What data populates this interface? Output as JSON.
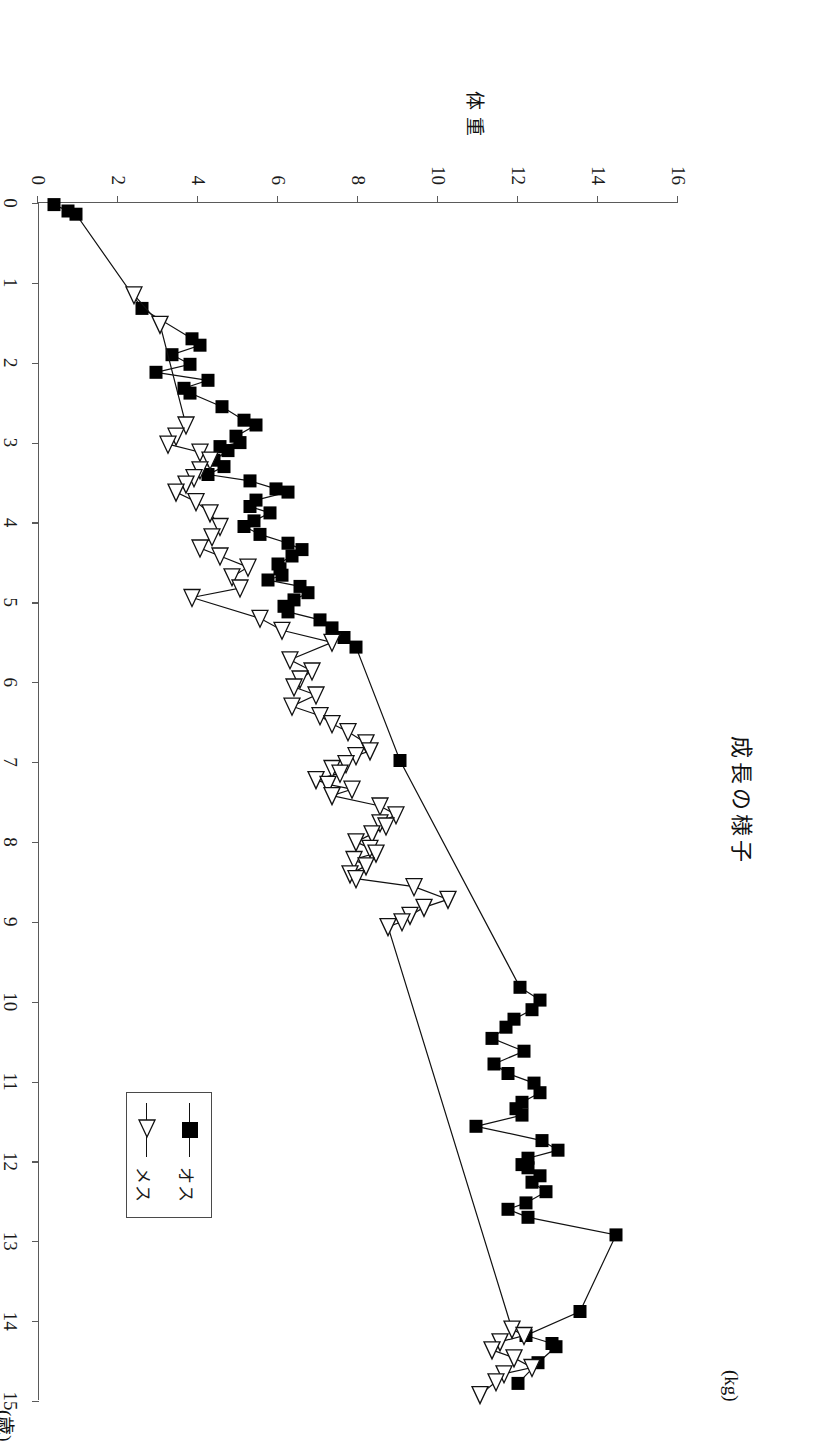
{
  "title": "成長の様子",
  "axes": {
    "x_title": "年齢",
    "x_unit": "(歳)",
    "y_title": "体重",
    "y_unit": "(kg)",
    "x_ticks": [
      "0",
      "1",
      "2",
      "3",
      "4",
      "5",
      "6",
      "7",
      "8",
      "9",
      "10",
      "11",
      "12",
      "13",
      "14",
      "15"
    ],
    "y_ticks": [
      "0",
      "2",
      "4",
      "6",
      "8",
      "10",
      "12",
      "14",
      "16"
    ],
    "x_min": 0,
    "x_max": 15,
    "y_min": 0,
    "y_max": 16
  },
  "legend": {
    "items": [
      {
        "label": "オス",
        "marker": "filled-square"
      },
      {
        "label": "メス",
        "marker": "open-triangle"
      }
    ]
  },
  "chart_data": {
    "type": "line",
    "title": "成長の様子",
    "xlabel": "年齢 (歳)",
    "ylabel": "体重 (kg)",
    "xlim": [
      0,
      15
    ],
    "ylim": [
      0,
      16
    ],
    "grid": false,
    "legend_position": "bottom-left",
    "series": [
      {
        "name": "オス",
        "marker": "filled-square",
        "points": [
          [
            0.02,
            0.4
          ],
          [
            0.1,
            0.75
          ],
          [
            0.14,
            0.95
          ],
          [
            1.32,
            2.6
          ],
          [
            1.7,
            3.85
          ],
          [
            1.78,
            4.05
          ],
          [
            1.9,
            3.35
          ],
          [
            2.02,
            3.8
          ],
          [
            2.12,
            2.95
          ],
          [
            2.22,
            4.25
          ],
          [
            2.32,
            3.65
          ],
          [
            2.38,
            3.8
          ],
          [
            2.55,
            4.6
          ],
          [
            2.72,
            5.15
          ],
          [
            2.78,
            5.45
          ],
          [
            2.92,
            4.95
          ],
          [
            3.0,
            5.05
          ],
          [
            3.05,
            4.55
          ],
          [
            3.1,
            4.75
          ],
          [
            3.22,
            4.4
          ],
          [
            3.3,
            4.65
          ],
          [
            3.4,
            4.25
          ],
          [
            3.48,
            5.3
          ],
          [
            3.58,
            5.95
          ],
          [
            3.62,
            6.25
          ],
          [
            3.72,
            5.45
          ],
          [
            3.8,
            5.3
          ],
          [
            3.88,
            5.8
          ],
          [
            3.98,
            5.4
          ],
          [
            4.05,
            5.15
          ],
          [
            4.15,
            5.55
          ],
          [
            4.26,
            6.25
          ],
          [
            4.34,
            6.6
          ],
          [
            4.42,
            6.35
          ],
          [
            4.52,
            6.0
          ],
          [
            4.58,
            6.05
          ],
          [
            4.66,
            6.1
          ],
          [
            4.72,
            5.75
          ],
          [
            4.8,
            6.55
          ],
          [
            4.88,
            6.75
          ],
          [
            4.97,
            6.4
          ],
          [
            5.05,
            6.15
          ],
          [
            5.12,
            6.25
          ],
          [
            5.22,
            7.05
          ],
          [
            5.32,
            7.35
          ],
          [
            5.44,
            7.65
          ],
          [
            5.56,
            7.95
          ],
          [
            6.98,
            9.05
          ],
          [
            9.82,
            12.05
          ],
          [
            9.98,
            12.55
          ],
          [
            10.1,
            12.35
          ],
          [
            10.22,
            11.9
          ],
          [
            10.32,
            11.7
          ],
          [
            10.46,
            11.35
          ],
          [
            10.62,
            12.15
          ],
          [
            10.78,
            11.4
          ],
          [
            10.9,
            11.75
          ],
          [
            11.02,
            12.4
          ],
          [
            11.14,
            12.55
          ],
          [
            11.26,
            12.1
          ],
          [
            11.34,
            11.95
          ],
          [
            11.42,
            12.1
          ],
          [
            11.56,
            10.95
          ],
          [
            11.74,
            12.6
          ],
          [
            11.86,
            13.0
          ],
          [
            11.96,
            12.25
          ],
          [
            12.04,
            12.1
          ],
          [
            12.08,
            12.25
          ],
          [
            12.18,
            12.55
          ],
          [
            12.26,
            12.35
          ],
          [
            12.38,
            12.7
          ],
          [
            12.52,
            12.2
          ],
          [
            12.6,
            11.75
          ],
          [
            12.7,
            12.25
          ],
          [
            12.92,
            14.45
          ],
          [
            13.88,
            13.55
          ],
          [
            14.18,
            12.2
          ],
          [
            14.28,
            12.85
          ],
          [
            14.32,
            12.95
          ],
          [
            14.52,
            12.5
          ],
          [
            14.78,
            12.0
          ]
        ]
      },
      {
        "name": "メス",
        "marker": "open-triangle",
        "points": [
          [
            1.15,
            2.4
          ],
          [
            1.52,
            3.05
          ],
          [
            2.78,
            3.7
          ],
          [
            2.92,
            3.45
          ],
          [
            3.02,
            3.25
          ],
          [
            3.12,
            4.05
          ],
          [
            3.22,
            4.3
          ],
          [
            3.34,
            4.05
          ],
          [
            3.44,
            3.9
          ],
          [
            3.52,
            3.7
          ],
          [
            3.62,
            3.45
          ],
          [
            3.74,
            3.95
          ],
          [
            3.88,
            4.3
          ],
          [
            4.05,
            4.55
          ],
          [
            4.18,
            4.35
          ],
          [
            4.32,
            4.05
          ],
          [
            4.42,
            4.55
          ],
          [
            4.56,
            5.25
          ],
          [
            4.68,
            4.85
          ],
          [
            4.82,
            5.05
          ],
          [
            4.94,
            3.85
          ],
          [
            5.2,
            5.55
          ],
          [
            5.35,
            6.1
          ],
          [
            5.5,
            7.35
          ],
          [
            5.72,
            6.3
          ],
          [
            5.86,
            6.85
          ],
          [
            5.96,
            6.55
          ],
          [
            6.06,
            6.4
          ],
          [
            6.16,
            6.95
          ],
          [
            6.3,
            6.35
          ],
          [
            6.42,
            7.05
          ],
          [
            6.52,
            7.35
          ],
          [
            6.62,
            7.75
          ],
          [
            6.76,
            8.2
          ],
          [
            6.86,
            8.3
          ],
          [
            6.92,
            7.95
          ],
          [
            7.02,
            7.7
          ],
          [
            7.08,
            7.35
          ],
          [
            7.14,
            7.55
          ],
          [
            7.22,
            6.95
          ],
          [
            7.28,
            7.25
          ],
          [
            7.34,
            7.85
          ],
          [
            7.42,
            7.35
          ],
          [
            7.55,
            8.55
          ],
          [
            7.66,
            8.95
          ],
          [
            7.76,
            8.55
          ],
          [
            7.8,
            8.7
          ],
          [
            7.9,
            8.35
          ],
          [
            8.0,
            7.95
          ],
          [
            8.08,
            8.3
          ],
          [
            8.14,
            8.45
          ],
          [
            8.22,
            7.9
          ],
          [
            8.3,
            8.2
          ],
          [
            8.4,
            7.8
          ],
          [
            8.46,
            7.95
          ],
          [
            8.56,
            9.4
          ],
          [
            8.72,
            10.25
          ],
          [
            8.82,
            9.65
          ],
          [
            8.92,
            9.3
          ],
          [
            9.0,
            9.1
          ],
          [
            9.06,
            8.75
          ],
          [
            14.1,
            11.85
          ],
          [
            14.18,
            12.15
          ],
          [
            14.26,
            11.55
          ],
          [
            14.36,
            11.35
          ],
          [
            14.46,
            11.9
          ],
          [
            14.58,
            12.35
          ],
          [
            14.66,
            11.65
          ],
          [
            14.76,
            11.45
          ],
          [
            14.92,
            11.05
          ]
        ]
      }
    ]
  }
}
